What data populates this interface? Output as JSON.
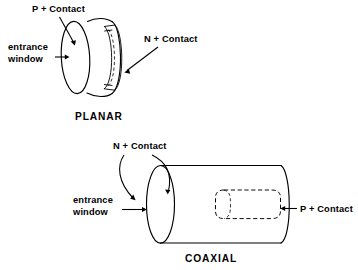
{
  "figure": {
    "background_color": "#ffffff",
    "line_color": "#000000"
  },
  "planar": {
    "caption": "PLANAR",
    "labels": {
      "p_contact": "P + Contact",
      "n_contact": "N + Contact",
      "entrance_window_line1": "entrance",
      "entrance_window_line2": "window"
    },
    "shape": "disk",
    "notes": "Short cylinder (disk) viewed at an angle; front circular face is the entrance window with P+ contact; rear face carries a grooved N+ contact band."
  },
  "coaxial": {
    "caption": "COAXIAL",
    "labels": {
      "n_contact": "N + Contact",
      "p_contact": "P + Contact",
      "entrance_window_line1": "entrance",
      "entrance_window_line2": "window"
    },
    "shape": "cylinder",
    "notes": "Long cylinder viewed at an angle; left elliptical end face is the entrance window; N+ contact wraps the outer surface and front face; a dashed interior bore from the right end carries the P+ contact."
  },
  "icons": {
    "arrow_right": "arrow-right-icon",
    "arrow_left": "arrow-left-icon",
    "curved_arrow": "curved-arrow-icon",
    "leader_arrow": "leader-arrow-icon"
  }
}
